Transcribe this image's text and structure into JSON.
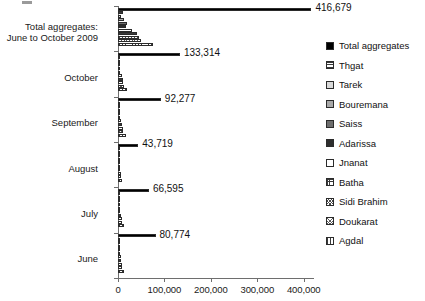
{
  "chart_data": {
    "type": "bar",
    "orientation": "horizontal",
    "title": "",
    "subtitle": "",
    "xlabel": "",
    "ylabel": "",
    "xlim": [
      0,
      420000
    ],
    "grid": false,
    "legend_position": "right",
    "xticks": [
      0,
      100000,
      200000,
      300000,
      400000
    ],
    "xtick_labels": [
      "0",
      "100,000",
      "200,000",
      "300,000",
      "400,000"
    ],
    "categories": [
      "Total aggregates:\nJune to October 2009",
      "October",
      "September",
      "August",
      "July",
      "June"
    ],
    "category_labels": [
      [
        "Total aggregates:",
        "June to October 2009"
      ],
      [
        "October"
      ],
      [
        "September"
      ],
      [
        "August"
      ],
      [
        "July"
      ],
      [
        "June"
      ]
    ],
    "series": [
      {
        "name": "Total aggregates",
        "pattern": "solid-black",
        "values": [
          416679,
          133314,
          92277,
          43719,
          66595,
          80774
        ]
      },
      {
        "name": "Thgat",
        "pattern": "horizontal-lines",
        "values": [
          9800,
          2600,
          2400,
          1500,
          1700,
          1600
        ]
      },
      {
        "name": "Tarek",
        "pattern": "light-gray",
        "values": [
          7300,
          2000,
          1800,
          1100,
          1300,
          1200
        ]
      },
      {
        "name": "Bouremana",
        "pattern": "mid-gray",
        "values": [
          13500,
          3400,
          3100,
          1900,
          2400,
          2500
        ]
      },
      {
        "name": "Saiss",
        "pattern": "dark-gray",
        "values": [
          19500,
          4600,
          4300,
          2600,
          3200,
          3400
        ]
      },
      {
        "name": "Adarissa",
        "pattern": "very-dark",
        "values": [
          16800,
          4000,
          3700,
          2200,
          2800,
          2900
        ]
      },
      {
        "name": "Jnanat",
        "pattern": "white",
        "values": [
          31000,
          7600,
          7100,
          3900,
          5200,
          5400
        ]
      },
      {
        "name": "Batha",
        "pattern": "grid",
        "values": [
          40000,
          9700,
          9000,
          5000,
          6700,
          7000
        ]
      },
      {
        "name": "Sidi Brahim",
        "pattern": "fine-dots",
        "values": [
          45000,
          11000,
          10200,
          5600,
          7600,
          7900
        ]
      },
      {
        "name": "Doukarat",
        "pattern": "fine-dots-2",
        "values": [
          49000,
          12000,
          11100,
          6100,
          8300,
          8600
        ]
      },
      {
        "name": "Agdal",
        "pattern": "vertical-lines",
        "values": [
          76000,
          18500,
          17200,
          9400,
          12800,
          13300
        ]
      }
    ],
    "value_labels": [
      {
        "category": "Total aggregates: June to October 2009",
        "text": "416,679"
      },
      {
        "category": "October",
        "text": "133,314"
      },
      {
        "category": "September",
        "text": "92,277"
      },
      {
        "category": "August",
        "text": "43,719"
      },
      {
        "category": "July",
        "text": "66,595"
      },
      {
        "category": "June",
        "text": "80,774"
      }
    ],
    "legend_entries": [
      "Total aggregates",
      "Thgat",
      "Tarek",
      "Bouremana",
      "Saiss",
      "Adarissa",
      "Jnanat",
      "Batha",
      "Sidi Brahim",
      "Doukarat",
      "Agdal"
    ]
  }
}
